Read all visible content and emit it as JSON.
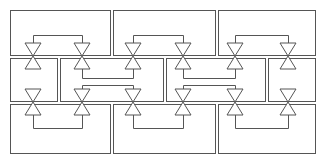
{
  "diagram": {
    "type": "valve-cell-grid",
    "stroke_color": "#555555",
    "background": "#ffffff",
    "rows": [
      {
        "name": "top-row",
        "cells": [
          {
            "x": 10,
            "y": 10,
            "w": 100,
            "h": 45
          },
          {
            "x": 113,
            "y": 10,
            "w": 102,
            "h": 45
          },
          {
            "x": 218,
            "y": 10,
            "w": 97,
            "h": 45
          }
        ]
      },
      {
        "name": "middle-row",
        "cells": [
          {
            "x": 10,
            "y": 58,
            "w": 47,
            "h": 43
          },
          {
            "x": 60,
            "y": 58,
            "w": 103,
            "h": 43
          },
          {
            "x": 166,
            "y": 58,
            "w": 99,
            "h": 43
          },
          {
            "x": 268,
            "y": 58,
            "w": 47,
            "h": 43
          }
        ]
      },
      {
        "name": "bottom-row",
        "cells": [
          {
            "x": 10,
            "y": 104,
            "w": 100,
            "h": 49
          },
          {
            "x": 113,
            "y": 104,
            "w": 102,
            "h": 49
          },
          {
            "x": 218,
            "y": 104,
            "w": 97,
            "h": 49
          }
        ]
      }
    ],
    "valve_columns": [
      33,
      82,
      133,
      183,
      235,
      288
    ],
    "valve_rows": [
      {
        "name": "upper-valve-row",
        "y": 56
      },
      {
        "name": "lower-valve-row",
        "y": 102
      }
    ],
    "valve_size": {
      "half_width": 8,
      "height": 12
    },
    "links": [
      {
        "name": "top-link-1",
        "x1": 33,
        "x2": 82,
        "y": 35,
        "dir": "down"
      },
      {
        "name": "top-link-2",
        "x1": 133,
        "x2": 183,
        "y": 35,
        "dir": "down"
      },
      {
        "name": "top-link-3",
        "x1": 235,
        "x2": 288,
        "y": 35,
        "dir": "down"
      },
      {
        "name": "mid-upper-link-1",
        "x1": 82,
        "x2": 133,
        "y": 78,
        "dir": "up"
      },
      {
        "name": "mid-upper-link-2",
        "x1": 183,
        "x2": 235,
        "y": 78,
        "dir": "up"
      },
      {
        "name": "mid-lower-link-1",
        "x1": 82,
        "x2": 133,
        "y": 85,
        "dir": "down"
      },
      {
        "name": "mid-lower-link-2",
        "x1": 183,
        "x2": 235,
        "y": 85,
        "dir": "down"
      },
      {
        "name": "bottom-link-1",
        "x1": 33,
        "x2": 82,
        "y": 128,
        "dir": "up"
      },
      {
        "name": "bottom-link-2",
        "x1": 133,
        "x2": 183,
        "y": 128,
        "dir": "up"
      },
      {
        "name": "bottom-link-3",
        "x1": 235,
        "x2": 288,
        "y": 128,
        "dir": "up"
      }
    ]
  }
}
